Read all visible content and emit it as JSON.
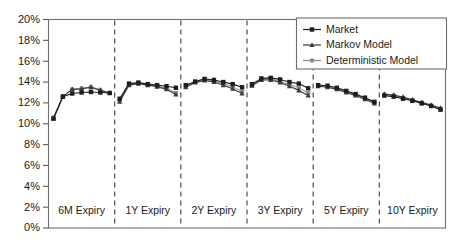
{
  "chart_data": {
    "type": "line",
    "title": "",
    "subtitle": "",
    "xlabel": "",
    "ylabel": "",
    "ylim": [
      0,
      20
    ],
    "y_unit": "%",
    "grid": false,
    "legend_position": "top-right",
    "y_ticks": [
      "0%",
      "2%",
      "4%",
      "6%",
      "8%",
      "10%",
      "12%",
      "14%",
      "16%",
      "18%",
      "20%"
    ],
    "y_tick_values": [
      0,
      2,
      4,
      6,
      8,
      10,
      12,
      14,
      16,
      18,
      20
    ],
    "panels": [
      {
        "label": "6M Expiry",
        "x": [
          0,
          1,
          2,
          3,
          4,
          5,
          6
        ],
        "series": [
          {
            "name": "Market",
            "values": [
              10.5,
              12.6,
              12.9,
              13.0,
              13.05,
              13.0,
              12.95
            ]
          },
          {
            "name": "Markov Model",
            "values": [
              10.5,
              12.6,
              13.3,
              13.35,
              13.5,
              13.2,
              12.95
            ]
          },
          {
            "name": "Deterministic Model",
            "values": [
              10.6,
              12.65,
              13.3,
              13.4,
              13.55,
              13.25,
              12.95
            ]
          }
        ]
      },
      {
        "label": "1Y Expiry",
        "x": [
          0,
          1,
          2,
          3,
          4,
          5,
          6
        ],
        "series": [
          {
            "name": "Market",
            "values": [
              12.4,
              13.85,
              13.95,
              13.8,
              13.7,
              13.6,
              13.45
            ]
          },
          {
            "name": "Markov Model",
            "values": [
              12.1,
              13.7,
              13.85,
              13.7,
              13.55,
              13.3,
              12.8
            ]
          },
          {
            "name": "Deterministic Model",
            "values": [
              12.2,
              13.75,
              13.9,
              13.75,
              13.6,
              13.4,
              12.95
            ]
          }
        ]
      },
      {
        "label": "2Y Expiry",
        "x": [
          0,
          1,
          2,
          3,
          4,
          5,
          6
        ],
        "series": [
          {
            "name": "Market",
            "values": [
              13.7,
              14.05,
              14.3,
              14.2,
              14.0,
              13.8,
              13.5
            ]
          },
          {
            "name": "Markov Model",
            "values": [
              13.5,
              13.95,
              14.15,
              14.0,
              13.7,
              13.35,
              12.9
            ]
          },
          {
            "name": "Deterministic Model",
            "values": [
              13.6,
              14.0,
              14.2,
              14.1,
              13.85,
              13.55,
              13.1
            ]
          }
        ]
      },
      {
        "label": "3Y Expiry",
        "x": [
          0,
          1,
          2,
          3,
          4,
          5,
          6
        ],
        "series": [
          {
            "name": "Market",
            "values": [
              13.8,
              14.35,
              14.4,
              14.25,
              14.0,
              13.85,
              13.4
            ]
          },
          {
            "name": "Markov Model",
            "values": [
              13.65,
              14.2,
              14.2,
              13.95,
              13.6,
              13.2,
              12.7
            ]
          },
          {
            "name": "Deterministic Model",
            "values": [
              13.7,
              14.25,
              14.3,
              14.05,
              13.75,
              13.45,
              12.95
            ]
          }
        ]
      },
      {
        "label": "5Y Expiry",
        "x": [
          0,
          1,
          2,
          3,
          4,
          5,
          6
        ],
        "series": [
          {
            "name": "Market",
            "values": [
              13.7,
              13.65,
              13.45,
              13.15,
              12.85,
              12.5,
              12.1
            ]
          },
          {
            "name": "Markov Model",
            "values": [
              13.6,
              13.5,
              13.3,
              13.0,
              12.7,
              12.35,
              11.95
            ]
          },
          {
            "name": "Deterministic Model",
            "values": [
              13.65,
              13.6,
              13.4,
              13.1,
              12.8,
              12.45,
              12.05
            ]
          }
        ]
      },
      {
        "label": "10Y Expiry",
        "x": [
          0,
          1,
          2,
          3,
          4,
          5,
          6
        ],
        "series": [
          {
            "name": "Market",
            "values": [
              12.7,
              12.6,
              12.4,
              12.2,
              11.95,
              11.7,
              11.35
            ]
          },
          {
            "name": "Markov Model",
            "values": [
              12.85,
              12.75,
              12.55,
              12.3,
              12.05,
              11.8,
              11.5
            ]
          },
          {
            "name": "Deterministic Model",
            "values": [
              12.8,
              12.7,
              12.5,
              12.25,
              12.0,
              11.75,
              11.45
            ]
          }
        ]
      }
    ],
    "legend": [
      {
        "label": "Market",
        "marker": "square",
        "color": "#1d1d1d"
      },
      {
        "label": "Markov Model",
        "marker": "triangle",
        "color": "#3c3c3c"
      },
      {
        "label": "Deterministic Model",
        "marker": "circle",
        "color": "#8c8c8c"
      }
    ]
  },
  "colors": {
    "market": "#1d1d1d",
    "markov": "#3c3c3c",
    "deterministic": "#8c8c8c",
    "frame": "#6e6e6e",
    "divider": "#4d4d4d",
    "text": "#1a1a1a",
    "background": "#ffffff"
  }
}
